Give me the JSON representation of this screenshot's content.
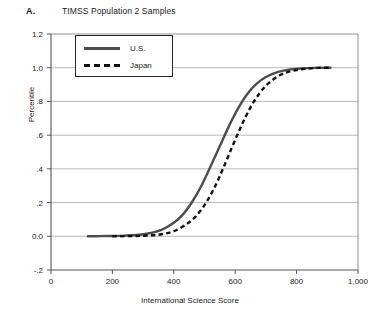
{
  "panel": {
    "letter": "A.",
    "title": "TIMSS Population 2 Samples"
  },
  "chart_data": {
    "type": "line",
    "title": "TIMSS Population 2 Samples",
    "xlabel": "International Science Score",
    "ylabel": "Percentile",
    "xlim": [
      0,
      1000
    ],
    "ylim": [
      -0.2,
      1.2
    ],
    "xticks": [
      0,
      200,
      400,
      600,
      800,
      1000
    ],
    "xtick_labels": [
      "0",
      "200",
      "400",
      "600",
      "800",
      "1,000"
    ],
    "yticks": [
      -0.2,
      0.0,
      0.2,
      0.4,
      0.6,
      0.8,
      1.0,
      1.2
    ],
    "ytick_labels": [
      "-.2",
      "0.0",
      ".2",
      ".4",
      ".6",
      ".8",
      "1.0",
      "1.2"
    ],
    "grid": "horizontal",
    "legend_position": "top-left-inside",
    "series": [
      {
        "name": "U.S.",
        "style": "solid",
        "color": "#4d4d4d",
        "x": [
          120,
          160,
          200,
          240,
          280,
          320,
          360,
          400,
          430,
          460,
          490,
          520,
          550,
          580,
          610,
          640,
          670,
          700,
          740,
          780,
          820,
          860,
          910
        ],
        "y": [
          0.0,
          0.001,
          0.002,
          0.004,
          0.008,
          0.018,
          0.038,
          0.08,
          0.13,
          0.205,
          0.3,
          0.415,
          0.535,
          0.655,
          0.76,
          0.845,
          0.905,
          0.945,
          0.975,
          0.99,
          0.996,
          0.999,
          1.0
        ]
      },
      {
        "name": "Japan",
        "style": "dashed",
        "color": "#111111",
        "x": [
          200,
          240,
          280,
          320,
          360,
          400,
          440,
          470,
          500,
          530,
          560,
          590,
          620,
          650,
          680,
          710,
          750,
          790,
          830,
          870,
          910
        ],
        "y": [
          0.0,
          0.001,
          0.002,
          0.005,
          0.012,
          0.03,
          0.07,
          0.115,
          0.185,
          0.28,
          0.4,
          0.53,
          0.655,
          0.765,
          0.85,
          0.91,
          0.96,
          0.983,
          0.994,
          0.999,
          1.0
        ]
      }
    ]
  },
  "legend": {
    "items": [
      {
        "label": "U.S.",
        "style": "solid"
      },
      {
        "label": "Japan",
        "style": "dashed"
      }
    ]
  }
}
